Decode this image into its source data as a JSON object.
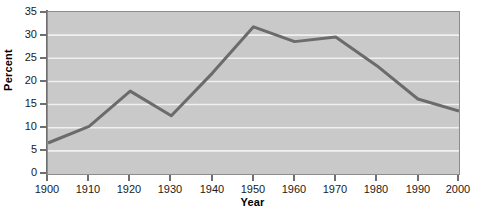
{
  "chart_data": {
    "type": "line",
    "title": "",
    "xlabel": "Year",
    "ylabel": "Percent",
    "x": [
      1900,
      1910,
      1920,
      1930,
      1940,
      1950,
      1960,
      1970,
      1980,
      1990,
      2000
    ],
    "values": [
      6.7,
      10.3,
      17.9,
      12.6,
      21.8,
      31.8,
      28.6,
      29.6,
      23.4,
      16.2,
      13.6
    ],
    "series": [
      {
        "name": "Percent",
        "values": [
          6.7,
          10.3,
          17.9,
          12.6,
          21.8,
          31.8,
          28.6,
          29.6,
          23.4,
          16.2,
          13.6
        ],
        "color": "#6b6b6b"
      }
    ],
    "xlim": [
      1900,
      2000
    ],
    "ylim": [
      0,
      35
    ],
    "yticks": [
      0,
      5,
      10,
      15,
      20,
      25,
      30,
      35
    ],
    "xticks": [
      1900,
      1910,
      1920,
      1930,
      1940,
      1950,
      1960,
      1970,
      1980,
      1990,
      2000
    ],
    "ytick_labels": [
      "0",
      "5",
      "10",
      "15",
      "20",
      "25",
      "30",
      "35"
    ],
    "xtick_labels": [
      "1900",
      "1910",
      "1920",
      "1930",
      "1940",
      "1950",
      "1960",
      "1970",
      "1980",
      "1990",
      "2000"
    ],
    "grid": {
      "horizontal": true,
      "vertical": false,
      "color": "#f0f0f0"
    },
    "legend": {
      "visible": false,
      "position": "none"
    },
    "plot_background": "#c9c9c9",
    "figure_background": "#ffffff",
    "line_width": 3
  }
}
